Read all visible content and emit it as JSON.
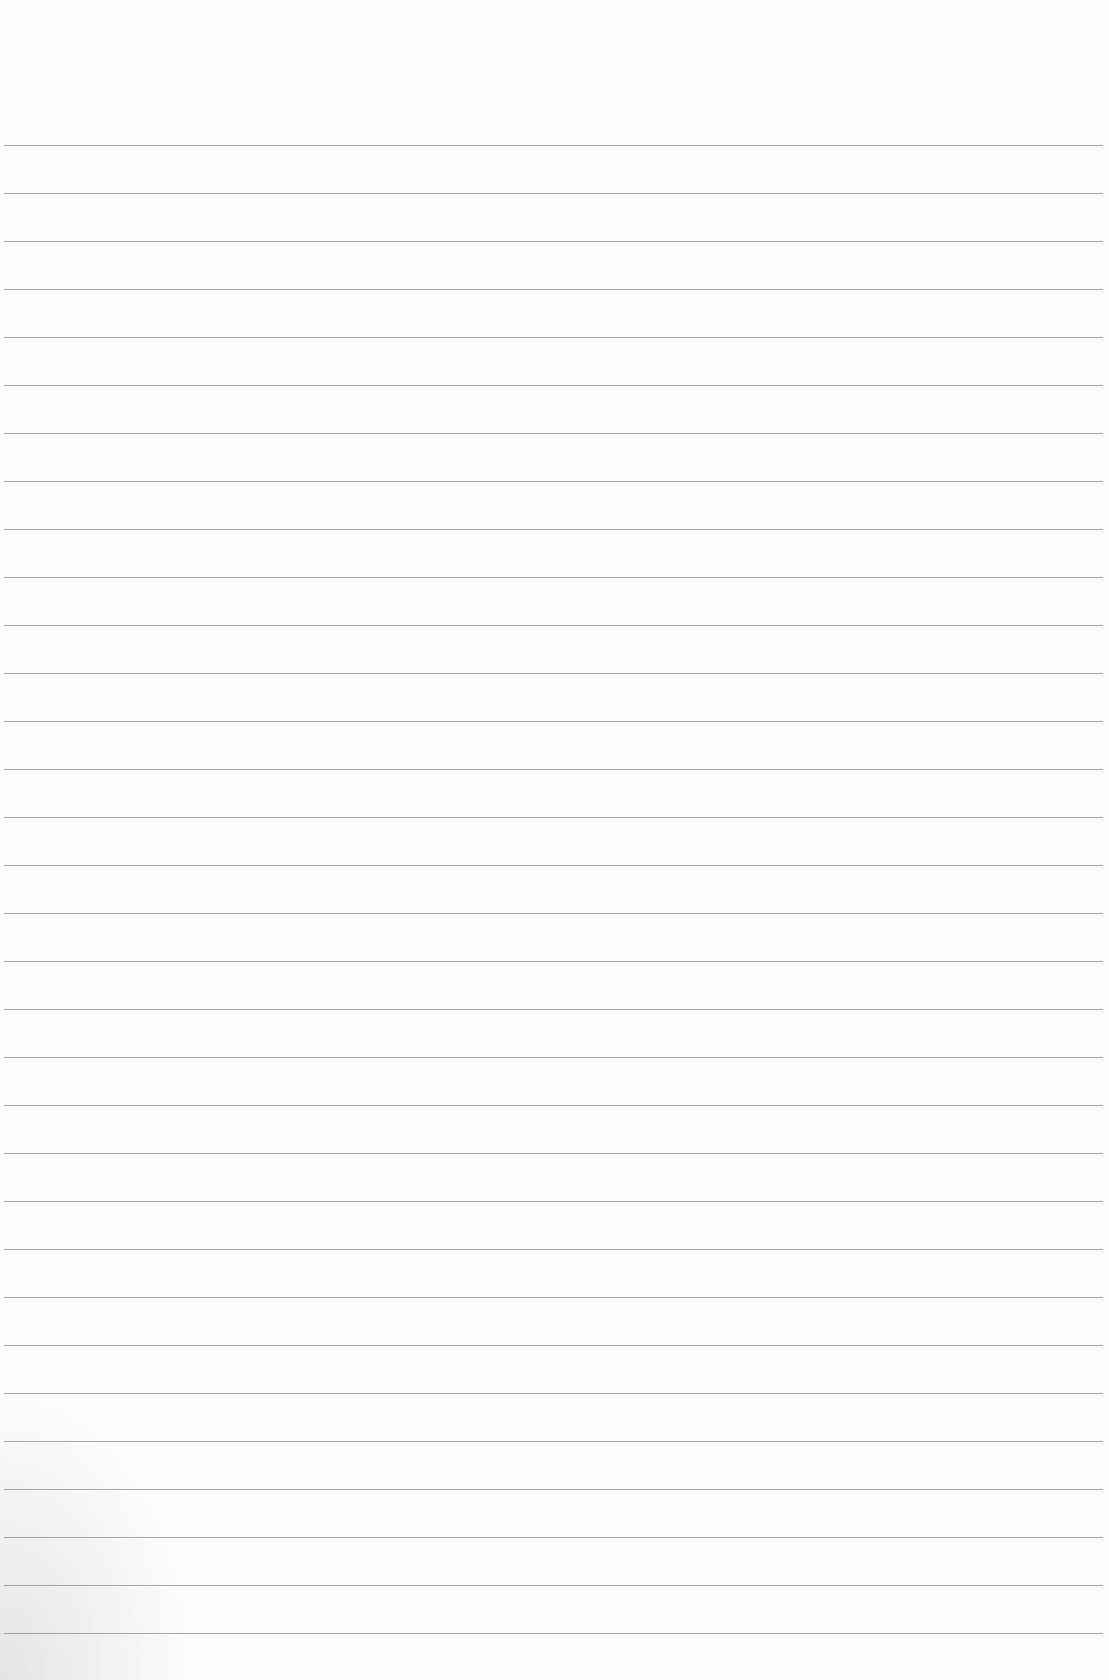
{
  "sheet": {
    "type": "blank lined paper",
    "line_color": "#8a8a8a",
    "background_color": "#fcfcfc",
    "first_line_y": 145,
    "line_spacing": 48,
    "line_count": 32
  }
}
